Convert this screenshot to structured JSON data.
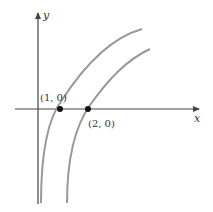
{
  "figure": {
    "axes": {
      "x_label": "x",
      "y_label": "y",
      "axis_color": "#444444"
    },
    "curves": [
      {
        "name": "y = ln x",
        "color": "#999999",
        "path": "M41,203 C41,150 48,118 62,100 C84,66 110,38 142,29"
      },
      {
        "name": "y = ln(x-1)",
        "color": "#999999",
        "path": "M67,203 C67,160 74,128 90,105 C108,80 126,60 150,49"
      }
    ],
    "points": [
      {
        "label": "(1, 0)",
        "x": 60,
        "y": 109
      },
      {
        "label": "(2, 0)",
        "x": 88,
        "y": 109
      }
    ]
  }
}
